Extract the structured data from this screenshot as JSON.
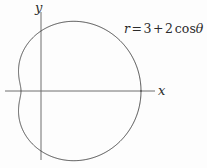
{
  "figure": {
    "title": "",
    "background_color": "#fdfdfd",
    "line_color": "#3a3a3a",
    "axis_color": "#6e6e6e",
    "text_color": "#2b2b2b"
  },
  "axes": {
    "x_label": "x",
    "y_label": "y",
    "x_axis_start_px": 5,
    "x_axis_end_px": 155,
    "y_axis_start_px": 12,
    "y_axis_end_px": 160,
    "origin_x_px": 41,
    "origin_y_px": 91,
    "pixels_per_unit": 20
  },
  "annotation": {
    "equation_full": "r = 3 + 2 cos θ",
    "r_symbol": "r",
    "equals": "=",
    "constant": "3",
    "plus": "+",
    "coefficient": "2",
    "cos": "cos",
    "theta": "θ"
  },
  "chart_data": {
    "type": "line",
    "title": "",
    "xlabel": "x",
    "ylabel": "y",
    "grid": false,
    "legend": null,
    "curve_name": "limacon r = 3 + 2 cos theta",
    "polar_equation": {
      "form": "r = a + b cos(theta)",
      "a": 3,
      "b": 2,
      "trig": "cos"
    },
    "r_values_by_theta_deg": [
      {
        "theta": 0,
        "r": 5.0
      },
      {
        "theta": 15,
        "r": 4.932
      },
      {
        "theta": 30,
        "r": 4.732
      },
      {
        "theta": 45,
        "r": 4.414
      },
      {
        "theta": 60,
        "r": 4.0
      },
      {
        "theta": 75,
        "r": 3.518
      },
      {
        "theta": 90,
        "r": 3.0
      },
      {
        "theta": 105,
        "r": 2.482
      },
      {
        "theta": 120,
        "r": 2.0
      },
      {
        "theta": 135,
        "r": 1.586
      },
      {
        "theta": 150,
        "r": 1.268
      },
      {
        "theta": 165,
        "r": 1.068
      },
      {
        "theta": 180,
        "r": 1.0
      },
      {
        "theta": 195,
        "r": 1.068
      },
      {
        "theta": 210,
        "r": 1.268
      },
      {
        "theta": 225,
        "r": 1.586
      },
      {
        "theta": 240,
        "r": 2.0
      },
      {
        "theta": 255,
        "r": 2.482
      },
      {
        "theta": 270,
        "r": 3.0
      },
      {
        "theta": 285,
        "r": 3.518
      },
      {
        "theta": 300,
        "r": 4.0
      },
      {
        "theta": 315,
        "r": 4.414
      },
      {
        "theta": 330,
        "r": 4.732
      },
      {
        "theta": 345,
        "r": 4.932
      },
      {
        "theta": 360,
        "r": 5.0
      }
    ],
    "extrema": {
      "max_r": 5.0,
      "max_r_theta_deg": 0,
      "min_r": 1.0,
      "min_r_theta_deg": 180,
      "r_at_theta_90": 3.0,
      "r_at_theta_270": 3.0
    },
    "xlim": [
      -1.8,
      5.8
    ],
    "ylim": [
      -3.7,
      3.7
    ],
    "shape": "convex limacon with dimple"
  }
}
